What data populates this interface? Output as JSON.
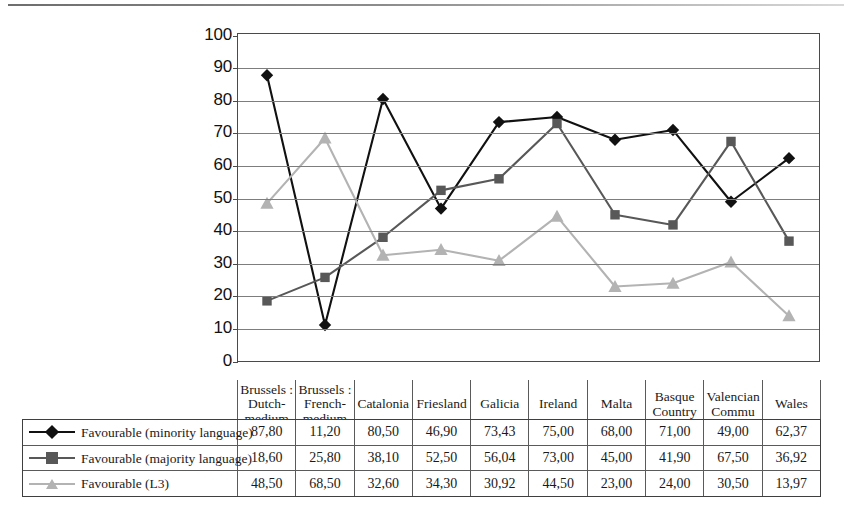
{
  "chart_data": {
    "type": "line",
    "title": "",
    "xlabel": "",
    "ylabel": "",
    "ylim": [
      0,
      100
    ],
    "ytick_step": 10,
    "grid": true,
    "legend_position": "bottom-table",
    "categories": [
      "Brussels : Dutch-medium",
      "Brussels : French-medium",
      "Catalonia",
      "Friesland",
      "Galicia",
      "Ireland",
      "Malta",
      "Basque Country",
      "Valencian Commu",
      "Wales"
    ],
    "yticks": [
      "0",
      "10",
      "20",
      "30",
      "40",
      "50",
      "60",
      "70",
      "80",
      "90",
      "100"
    ],
    "series": [
      {
        "name": "Favourable (minority language)",
        "marker": "diamond",
        "color": "#111111",
        "values": [
          87.8,
          11.2,
          80.5,
          46.9,
          73.43,
          75.0,
          68.0,
          71.0,
          49.0,
          62.37
        ],
        "labels": [
          "87,80",
          "11,20",
          "80,50",
          "46,90",
          "73,43",
          "75,00",
          "68,00",
          "71,00",
          "49,00",
          "62,37"
        ]
      },
      {
        "name": "Favourable (majority language)",
        "marker": "square",
        "color": "#585858",
        "values": [
          18.6,
          25.8,
          38.1,
          52.5,
          56.04,
          73.0,
          45.0,
          41.9,
          67.5,
          36.92
        ],
        "labels": [
          "18,60",
          "25,80",
          "38,10",
          "52,50",
          "56,04",
          "73,00",
          "45,00",
          "41,90",
          "67,50",
          "36,92"
        ]
      },
      {
        "name": "Favourable (L3)",
        "marker": "triangle",
        "color": "#b3b3b3",
        "values": [
          48.5,
          68.5,
          32.6,
          34.3,
          30.92,
          44.5,
          23.0,
          24.0,
          30.5,
          13.97
        ],
        "labels": [
          "48,50",
          "68,50",
          "32,60",
          "34,30",
          "30,92",
          "44,50",
          "23,00",
          "24,00",
          "30,50",
          "13,97"
        ]
      }
    ]
  },
  "colors": {
    "gridline": "#7d7d7d",
    "axis": "#4a4a4a",
    "series_minority": "#111111",
    "series_majority": "#585858",
    "series_l3": "#b3b3b3",
    "table_border": "#5a5a5a"
  }
}
